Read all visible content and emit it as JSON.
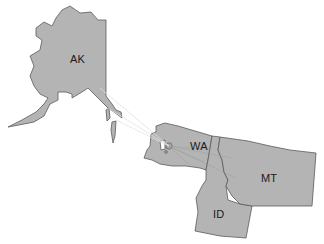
{
  "map": {
    "background": "#ffffff",
    "fill_color": "#b4b4b4",
    "border_color": "#5a5a5a",
    "hub": {
      "name": "Seattle-area hub",
      "x": 169,
      "y": 146
    },
    "states": [
      {
        "code": "AK",
        "label": "AK",
        "label_x": 70,
        "label_y": 53
      },
      {
        "code": "WA",
        "label": "WA",
        "label_x": 190,
        "label_y": 140
      },
      {
        "code": "MT",
        "label": "MT",
        "label_x": 261,
        "label_y": 172
      },
      {
        "code": "ID",
        "label": "ID",
        "label_x": 213,
        "label_y": 208
      }
    ]
  }
}
